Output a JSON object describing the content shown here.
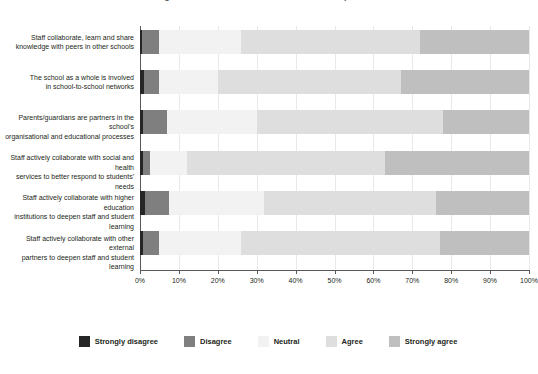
{
  "chart_data": {
    "type": "bar",
    "orientation": "horizontal",
    "stacked": true,
    "normalized_percent": true,
    "title": "Figure 1. School collaboration with external partners",
    "xlabel": "",
    "ylabel": "",
    "xlim": [
      0,
      100
    ],
    "xticks": [
      "0%",
      "10%",
      "20%",
      "30%",
      "40%",
      "50%",
      "60%",
      "70%",
      "80%",
      "90%",
      "100%"
    ],
    "grid": "vertical",
    "legend_position": "bottom",
    "categories": [
      "Staff collaborate, learn and share knowledge with peers in other schools",
      "The school as a whole is involved in school-to-school networks",
      "Parents/guardians are partners in the school's organisational and educational processes",
      "Staff actively collaborate with social and health services to better respond to students' needs",
      "Staff actively collaborate with higher education institutions to deepen staff and student learning",
      "Staff actively collaborate with other external partners to deepen staff and student learning"
    ],
    "category_lines": [
      [
        "Staff collaborate, learn and share",
        "knowledge with peers in other schools"
      ],
      [
        "The school as a whole is involved",
        "in school-to-school networks"
      ],
      [
        "Parents/guardians are partners in the school's",
        "organisational and educational processes"
      ],
      [
        "Staff actively collaborate with social and health",
        "services to better respond to students' needs"
      ],
      [
        "Staff actively collaborate with higher education",
        "institutions to deepen staff and student learning"
      ],
      [
        "Staff actively collaborate with other external",
        "partners to deepen staff and student learning"
      ]
    ],
    "series": [
      {
        "name": "Strongly disagree",
        "color": "#262626",
        "values": [
          0.6,
          1.0,
          0.8,
          0.8,
          1.2,
          0.8
        ]
      },
      {
        "name": "Disagree",
        "color": "#7f7f7f",
        "values": [
          4.4,
          4.0,
          6.2,
          1.7,
          6.3,
          4.2
        ]
      },
      {
        "name": "Neutral",
        "color": "#f2f2f2",
        "values": [
          21.0,
          15.0,
          23.0,
          9.5,
          24.5,
          21.0
        ]
      },
      {
        "name": "Agree",
        "color": "#dedede",
        "values": [
          46.0,
          47.0,
          48.0,
          51.0,
          44.0,
          51.0
        ]
      },
      {
        "name": "Strongly agree",
        "color": "#bfbfbf",
        "values": [
          28.0,
          33.0,
          22.0,
          37.0,
          24.0,
          23.0
        ]
      }
    ]
  },
  "legend": {
    "items": [
      {
        "label": "Strongly disagree",
        "color": "#262626"
      },
      {
        "label": "Disagree",
        "color": "#7f7f7f"
      },
      {
        "label": "Neutral",
        "color": "#f2f2f2"
      },
      {
        "label": "Agree",
        "color": "#dedede"
      },
      {
        "label": "Strongly agree",
        "color": "#bfbfbf"
      }
    ]
  }
}
